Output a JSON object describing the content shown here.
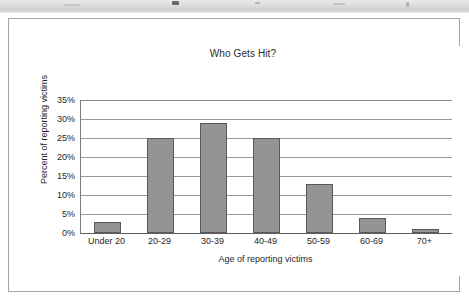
{
  "top_strip": {
    "name": "cropped-window-toolbar-strip"
  },
  "chart_data": {
    "type": "bar",
    "title": "Who Gets Hit?",
    "xlabel": "Age of reporting victims",
    "ylabel": "Percent of reporting victims",
    "categories": [
      "Under 20",
      "20-29",
      "30-39",
      "40-49",
      "50-59",
      "60-69",
      "70+"
    ],
    "values": [
      3,
      25,
      29,
      25,
      13,
      4,
      1
    ],
    "ylim": [
      0,
      35
    ],
    "ytick_labels": [
      "35%",
      "30%",
      "25%",
      "20%",
      "15%",
      "10%",
      "5%",
      "0%"
    ],
    "ytick_values": [
      35,
      30,
      25,
      20,
      15,
      10,
      5,
      0
    ],
    "grid": true,
    "legend": false,
    "bar_color": "#949494",
    "bar_border_color": "#59595b",
    "plot_bg": "#ffffff",
    "axis_color": "#5e5e5e",
    "grid_color": "#9a9a9a"
  }
}
